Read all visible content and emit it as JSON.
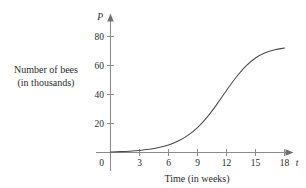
{
  "figure": {
    "background_color": "#ffffff",
    "axis_color": "#8b8b8b",
    "curve_color": "#4a4a4a",
    "text_color": "#2b2b2b"
  },
  "labels": {
    "y_axis_variable": "P",
    "x_axis_variable": "t",
    "y_axis_title_line1": "Number of bees",
    "y_axis_title_line2": "(in thousands)",
    "x_axis_title": "Time (in weeks)",
    "origin_label": "0"
  },
  "chart_data": {
    "type": "line",
    "title": "",
    "subtitle": "",
    "xlabel": "Time (in weeks)",
    "ylabel": "Number of bees (in thousands)",
    "x_variable": "t",
    "y_variable": "P",
    "xlim": [
      0,
      19.5
    ],
    "ylim": [
      0,
      88
    ],
    "grid": false,
    "legend": null,
    "x_ticks": [
      3,
      6,
      9,
      12,
      15,
      18
    ],
    "x_tick_labels": [
      "3",
      "6",
      "9",
      "12",
      "15",
      "18"
    ],
    "y_ticks": [
      20,
      40,
      60,
      80
    ],
    "y_tick_labels": [
      "20",
      "40",
      "60",
      "80"
    ],
    "origin_tick_label": "0",
    "series": [
      {
        "name": "Bee population",
        "x": [
          0,
          1,
          2,
          3,
          4,
          5,
          6,
          7,
          8,
          9,
          10,
          11,
          12,
          13,
          14,
          15,
          16,
          17,
          18
        ],
        "values": [
          0.4,
          0.6,
          0.9,
          1.4,
          2.2,
          3.4,
          5.2,
          7.9,
          11.8,
          17.2,
          24.4,
          33.2,
          42.8,
          51.9,
          59.6,
          65.2,
          68.8,
          70.9,
          72.0
        ]
      }
    ],
    "annotations": [],
    "curve_shape": "logistic growth (sigmoid), carrying capacity approximately 73 thousand bees",
    "inflection_point": {
      "t": 12,
      "P": 42.8
    }
  }
}
